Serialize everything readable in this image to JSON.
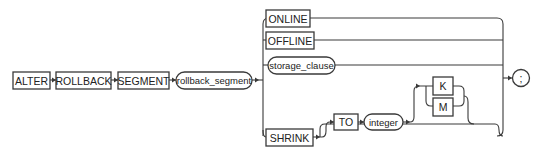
{
  "diagram": {
    "type": "railroad-syntax",
    "statement": "ALTER ROLLBACK SEGMENT",
    "main_sequence": [
      {
        "kind": "keyword",
        "label": "ALTER"
      },
      {
        "kind": "keyword",
        "label": "ROLLBACK"
      },
      {
        "kind": "keyword",
        "label": "SEGMENT"
      },
      {
        "kind": "nonterminal",
        "label": "rollback_segment"
      }
    ],
    "choices": [
      {
        "kind": "keyword",
        "label": "ONLINE"
      },
      {
        "kind": "keyword",
        "label": "OFFLINE"
      },
      {
        "kind": "nonterminal",
        "label": "storage_clause"
      },
      {
        "kind": "keyword",
        "label": "SHRINK"
      }
    ],
    "shrink_optional": {
      "to_label": "TO",
      "integer_label": "integer",
      "unit_options": [
        "K",
        "M"
      ]
    },
    "terminator": ";"
  }
}
